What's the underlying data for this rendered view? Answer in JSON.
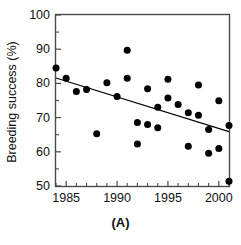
{
  "chart_data": {
    "type": "scatter",
    "title": "",
    "subtitle": "",
    "caption": "(A)",
    "xlabel": "",
    "ylabel": "Breeding success (%)",
    "xlim": [
      1984,
      2001
    ],
    "ylim": [
      50,
      100
    ],
    "grid": false,
    "legend": "none",
    "x_ticks_major": [
      1985,
      1990,
      1995,
      2000
    ],
    "x_tick_labels": [
      "1985",
      "1990",
      "1995",
      "2000"
    ],
    "x_ticks_minor": [
      1984,
      1986,
      1987,
      1988,
      1989,
      1991,
      1992,
      1993,
      1994,
      1996,
      1997,
      1998,
      1999,
      2001
    ],
    "y_ticks_major": [
      50,
      60,
      70,
      80,
      90,
      100
    ],
    "y_tick_labels": [
      "50",
      "60",
      "70",
      "80",
      "90",
      "100"
    ],
    "y_ticks_minor": [
      55,
      65,
      75,
      85,
      95
    ],
    "marker": "filled-circle",
    "marker_color": "#000000",
    "marker_size": 7,
    "series": [
      {
        "name": "Breeding success",
        "points": [
          {
            "x": 1984.0,
            "y": 84.5
          },
          {
            "x": 1985.0,
            "y": 81.5
          },
          {
            "x": 1986.0,
            "y": 77.6
          },
          {
            "x": 1987.0,
            "y": 78.2
          },
          {
            "x": 1988.0,
            "y": 65.3
          },
          {
            "x": 1989.0,
            "y": 80.2
          },
          {
            "x": 1990.0,
            "y": 76.2
          },
          {
            "x": 1991.0,
            "y": 89.7
          },
          {
            "x": 1991.0,
            "y": 81.5
          },
          {
            "x": 1992.0,
            "y": 68.6
          },
          {
            "x": 1992.0,
            "y": 62.3
          },
          {
            "x": 1993.0,
            "y": 78.4
          },
          {
            "x": 1993.0,
            "y": 68.0
          },
          {
            "x": 1994.0,
            "y": 73.0
          },
          {
            "x": 1994.0,
            "y": 67.0
          },
          {
            "x": 1995.0,
            "y": 81.2
          },
          {
            "x": 1995.0,
            "y": 75.7
          },
          {
            "x": 1996.0,
            "y": 73.8
          },
          {
            "x": 1997.0,
            "y": 71.4
          },
          {
            "x": 1997.0,
            "y": 61.6
          },
          {
            "x": 1998.0,
            "y": 79.5
          },
          {
            "x": 1998.0,
            "y": 70.7
          },
          {
            "x": 1999.0,
            "y": 66.5
          },
          {
            "x": 1999.0,
            "y": 59.6
          },
          {
            "x": 2000.0,
            "y": 74.9
          },
          {
            "x": 2000.0,
            "y": 61.0
          },
          {
            "x": 2001.0,
            "y": 67.7
          },
          {
            "x": 2001.0,
            "y": 51.4
          }
        ]
      }
    ],
    "trendline": {
      "type": "linear-regression",
      "color": "#000000",
      "x_start": 1984.0,
      "y_start": 81.6,
      "x_end": 2001.0,
      "y_end": 65.9
    }
  }
}
